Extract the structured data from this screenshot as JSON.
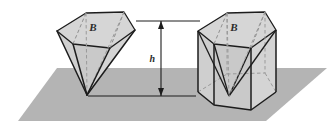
{
  "figure": {
    "ground_plane_color": "#b4b4b4",
    "solid_fill_color": "#d2d2d2",
    "solid_fill_color_dark": "#c2c2c2",
    "outline_color": "#1c1c1c",
    "hidden_edge_color": "#8c8c8c",
    "background_color": "#ffffff",
    "labels": {
      "base_area_left": "B",
      "base_area_right": "B",
      "height": "h"
    },
    "left_solid": {
      "name": "pentagonal-pyramid",
      "apex_position": "bottom",
      "base_position": "top"
    },
    "right_solid": {
      "name": "pentagonal-prism-with-inscribed-pyramid",
      "apex_position": "bottom-center",
      "base_position": "top"
    },
    "dimension": {
      "name": "height-dimension",
      "arrow_style": "double-headed-vertical",
      "top_reference_line": true,
      "bottom_reference_line": true
    }
  }
}
